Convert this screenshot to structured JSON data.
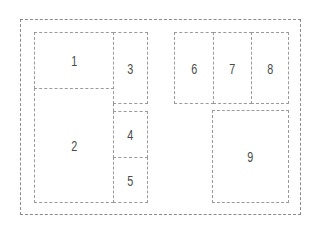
{
  "diagram": {
    "type": "page-layout-panels",
    "frame": {
      "label": ""
    },
    "panels": [
      {
        "id": "1",
        "label": "1"
      },
      {
        "id": "2",
        "label": "2"
      },
      {
        "id": "3",
        "label": "3"
      },
      {
        "id": "4",
        "label": "4"
      },
      {
        "id": "5",
        "label": "5"
      },
      {
        "id": "6",
        "label": "6"
      },
      {
        "id": "7",
        "label": "7"
      },
      {
        "id": "8",
        "label": "8"
      },
      {
        "id": "9",
        "label": "9"
      }
    ],
    "colors": {
      "line": "#9a9a9a",
      "frame_line": "#8a8a8a",
      "text": "#4a4a4a",
      "background": "#ffffff"
    }
  }
}
